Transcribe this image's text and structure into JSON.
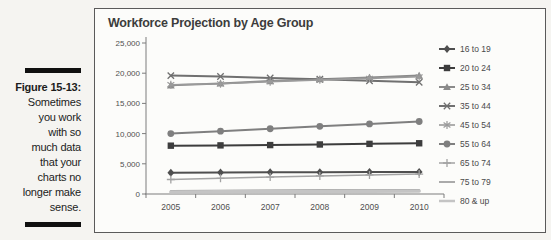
{
  "figure_caption": {
    "label": "Figure 15-13:",
    "text_lines": [
      "Sometimes",
      "you work",
      "with so",
      "much data",
      "that your",
      "charts no",
      "longer make",
      "sense."
    ]
  },
  "chart_data": {
    "type": "line",
    "title": "Workforce Projection by Age Group",
    "categories": [
      "2005",
      "2006",
      "2007",
      "2008",
      "2009",
      "2010"
    ],
    "xlabel": "",
    "ylabel": "",
    "ylim": [
      0,
      25000
    ],
    "y_tick_step": 5000,
    "y_tick_labels": [
      "0",
      "5,000",
      "10,000",
      "15,000",
      "20,000",
      "25,000"
    ],
    "grid": false,
    "legend_position": "right",
    "axis_color": "#7c7c7c",
    "tick_label_color": "#4f4f4f",
    "legend_label_color": "#4a4a4a",
    "series": [
      {
        "name": "16 to 19",
        "marker": "diamond",
        "color": "#4f4f4f",
        "width": 2,
        "values": [
          3500,
          3550,
          3600,
          3620,
          3640,
          3650
        ]
      },
      {
        "name": "20 to 24",
        "marker": "square",
        "color": "#3d3d3d",
        "width": 2,
        "values": [
          8000,
          8050,
          8100,
          8200,
          8300,
          8400
        ]
      },
      {
        "name": "25 to 34",
        "marker": "triangle",
        "color": "#8a8a8a",
        "width": 2,
        "values": [
          18000,
          18300,
          18700,
          19000,
          19300,
          19600
        ]
      },
      {
        "name": "35 to 44",
        "marker": "x",
        "color": "#707070",
        "width": 2,
        "values": [
          19600,
          19450,
          19200,
          19000,
          18750,
          18500
        ]
      },
      {
        "name": "45 to 54",
        "marker": "asterisk",
        "color": "#9a9a9a",
        "width": 1.6,
        "values": [
          18100,
          18250,
          18600,
          18900,
          19150,
          19400
        ]
      },
      {
        "name": "55 to 64",
        "marker": "circle",
        "color": "#7f7f7f",
        "width": 2,
        "values": [
          10000,
          10400,
          10800,
          11200,
          11600,
          12000
        ]
      },
      {
        "name": "65 to 74",
        "marker": "plus",
        "color": "#a3a3a3",
        "width": 1.5,
        "values": [
          2400,
          2600,
          2800,
          3000,
          3150,
          3300
        ]
      },
      {
        "name": "75 to 79",
        "marker": "none",
        "color": "#8f8f8f",
        "width": 1.5,
        "values": [
          550,
          580,
          620,
          650,
          680,
          720
        ]
      },
      {
        "name": "80 & up",
        "marker": "none",
        "color": "#c4c4c4",
        "width": 3.5,
        "values": [
          350,
          380,
          410,
          430,
          455,
          480
        ]
      }
    ]
  }
}
